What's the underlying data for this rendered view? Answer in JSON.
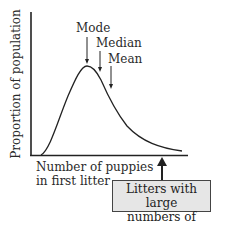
{
  "diagram": {
    "type": "right-skewed distribution curve",
    "y_axis_label": "Proportion of population",
    "x_axis_label_line1": "Number of puppies",
    "x_axis_label_line2": "in first litter",
    "annotations": {
      "mode": "Mode",
      "median": "Median",
      "mean": "Mean"
    },
    "callout": {
      "line1": "Litters with large",
      "line2": "numbers of puppies",
      "fill": "#e6e6e6"
    }
  }
}
